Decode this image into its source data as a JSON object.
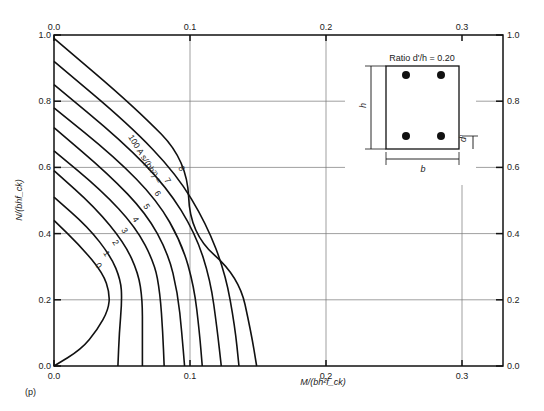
{
  "chart_data": {
    "type": "line",
    "title": "",
    "panel_label": "(p)",
    "xlabel": "M/(bh²f_ck)",
    "ylabel": "N/(bhf_ck)",
    "xlim": [
      0,
      0.33
    ],
    "ylim": [
      0,
      1.0
    ],
    "x_ticks": [
      "0.0",
      "0.1",
      "0.2",
      "0.3"
    ],
    "y_ticks": [
      "0.0",
      "0.2",
      "0.4",
      "0.6",
      "0.8",
      "1.0"
    ],
    "grid": true,
    "curve_family_label": "100 A s/(bh²) =",
    "annotation": "Ratio d'/h = 0.20",
    "section_labels": {
      "h": "h",
      "b": "b",
      "d": "d'"
    },
    "series": [
      {
        "name": "0",
        "points": [
          [
            0,
            0.44
          ],
          [
            0.02,
            0.36
          ],
          [
            0.036,
            0.28
          ],
          [
            0.041,
            0.22
          ],
          [
            0.04,
            0.17
          ],
          [
            0.032,
            0.11
          ],
          [
            0.02,
            0.05
          ],
          [
            0,
            0
          ]
        ]
      },
      {
        "name": "1",
        "points": [
          [
            0,
            0.51
          ],
          [
            0.025,
            0.42
          ],
          [
            0.042,
            0.33
          ],
          [
            0.049,
            0.26
          ],
          [
            0.05,
            0.2
          ],
          [
            0.048,
            0.1
          ],
          [
            0.047,
            0
          ]
        ]
      },
      {
        "name": "2",
        "points": [
          [
            0,
            0.59
          ],
          [
            0.03,
            0.48
          ],
          [
            0.052,
            0.37
          ],
          [
            0.062,
            0.28
          ],
          [
            0.065,
            0.2
          ],
          [
            0.065,
            0.1
          ],
          [
            0.065,
            0
          ]
        ]
      },
      {
        "name": "3",
        "points": [
          [
            0,
            0.65
          ],
          [
            0.035,
            0.53
          ],
          [
            0.06,
            0.42
          ],
          [
            0.074,
            0.31
          ],
          [
            0.078,
            0.22
          ],
          [
            0.08,
            0.1
          ],
          [
            0.081,
            0
          ]
        ]
      },
      {
        "name": "4",
        "points": [
          [
            0,
            0.72
          ],
          [
            0.04,
            0.58
          ],
          [
            0.068,
            0.46
          ],
          [
            0.084,
            0.34
          ],
          [
            0.091,
            0.22
          ],
          [
            0.094,
            0.1
          ],
          [
            0.096,
            0
          ]
        ]
      },
      {
        "name": "5",
        "points": [
          [
            0,
            0.78
          ],
          [
            0.045,
            0.63
          ],
          [
            0.076,
            0.5
          ],
          [
            0.094,
            0.37
          ],
          [
            0.103,
            0.24
          ],
          [
            0.107,
            0.1
          ],
          [
            0.109,
            0
          ]
        ]
      },
      {
        "name": "6",
        "points": [
          [
            0,
            0.85
          ],
          [
            0.05,
            0.68
          ],
          [
            0.083,
            0.54
          ],
          [
            0.104,
            0.4
          ],
          [
            0.115,
            0.26
          ],
          [
            0.12,
            0.11
          ],
          [
            0.123,
            0
          ]
        ]
      },
      {
        "name": "7",
        "points": [
          [
            0,
            0.92
          ],
          [
            0.055,
            0.73
          ],
          [
            0.09,
            0.58
          ],
          [
            0.112,
            0.43
          ],
          [
            0.126,
            0.28
          ],
          [
            0.133,
            0.12
          ],
          [
            0.136,
            0
          ]
        ]
      },
      {
        "name": "8",
        "points": [
          [
            0,
            0.99
          ],
          [
            0.06,
            0.78
          ],
          [
            0.098,
            0.62
          ],
          [
            0.1,
            0.4
          ],
          [
            0.136,
            0.27
          ],
          [
            0.145,
            0.1
          ],
          [
            0.149,
            0
          ]
        ]
      }
    ],
    "curve_labels": [
      "0",
      "1",
      "2",
      "3",
      "4",
      "5",
      "6",
      "7",
      "8"
    ]
  }
}
